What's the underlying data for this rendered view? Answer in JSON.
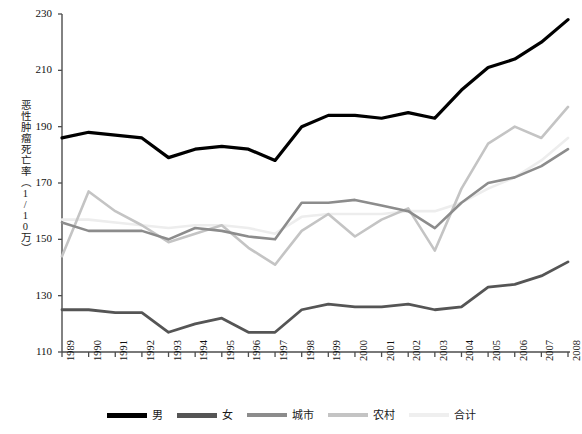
{
  "chart_data": {
    "type": "line",
    "title": "",
    "xlabel": "",
    "ylabel": "恶性肿瘤死亡率（1/10万）",
    "ylim": [
      110,
      230
    ],
    "yticks": [
      110,
      130,
      150,
      170,
      190,
      210,
      230
    ],
    "grid": false,
    "legend_position": "bottom",
    "categories": [
      "1989",
      "1990",
      "1991",
      "1992",
      "1993",
      "1994",
      "1995",
      "1996",
      "1997",
      "1998",
      "1999",
      "2000",
      "2001",
      "2002",
      "2003",
      "2004",
      "2005",
      "2006",
      "2007",
      "2008"
    ],
    "series": [
      {
        "name": "男",
        "color": "#000000",
        "width": 3.2,
        "values": [
          186,
          188,
          187,
          186,
          179,
          182,
          183,
          182,
          178,
          190,
          194,
          194,
          193,
          195,
          193,
          203,
          211,
          214,
          220,
          228
        ]
      },
      {
        "name": "女",
        "color": "#555555",
        "width": 2.8,
        "values": [
          125,
          125,
          124,
          124,
          117,
          120,
          122,
          117,
          117,
          125,
          127,
          126,
          126,
          127,
          125,
          126,
          133,
          134,
          137,
          142
        ]
      },
      {
        "name": "城市",
        "color": "#8c8c8c",
        "width": 2.6,
        "values": [
          156,
          153,
          153,
          153,
          150,
          154,
          153,
          151,
          150,
          163,
          163,
          164,
          162,
          160,
          154,
          163,
          170,
          172,
          176,
          182
        ]
      },
      {
        "name": "农村",
        "color": "#c4c4c4",
        "width": 2.6,
        "values": [
          144,
          167,
          160,
          155,
          149,
          152,
          155,
          147,
          141,
          153,
          159,
          151,
          157,
          161,
          146,
          168,
          184,
          190,
          186,
          197
        ]
      },
      {
        "name": "合计",
        "color": "#ededed",
        "width": 2.6,
        "values": [
          157,
          157,
          156,
          155,
          154,
          155,
          155,
          154,
          152,
          158,
          159,
          159,
          159,
          160,
          160,
          163,
          168,
          172,
          178,
          186
        ]
      }
    ]
  },
  "axes": {
    "y_tick_labels": [
      "230",
      "210",
      "190",
      "170",
      "150",
      "130",
      "110"
    ],
    "x_tick_labels": [
      "1989",
      "1990",
      "1991",
      "1992",
      "1993",
      "1994",
      "1995",
      "1996",
      "1997",
      "1998",
      "1999",
      "2000",
      "2001",
      "2002",
      "2003",
      "2004",
      "2005",
      "2006",
      "2007",
      "2008"
    ],
    "axis_color": "#4d4d4d",
    "y_title_chars": [
      "恶",
      "性",
      "肿",
      "瘤",
      "死",
      "亡",
      "率",
      "（",
      "1",
      "/",
      "1",
      "0",
      "万",
      "）"
    ]
  },
  "legend": {
    "items": [
      {
        "label": "男",
        "color": "#000000",
        "thickness": 5
      },
      {
        "label": "女",
        "color": "#555555",
        "thickness": 5
      },
      {
        "label": "城市",
        "color": "#8c8c8c",
        "thickness": 4
      },
      {
        "label": "农村",
        "color": "#c4c4c4",
        "thickness": 4
      },
      {
        "label": "合计",
        "color": "#efefef",
        "thickness": 4
      }
    ]
  }
}
